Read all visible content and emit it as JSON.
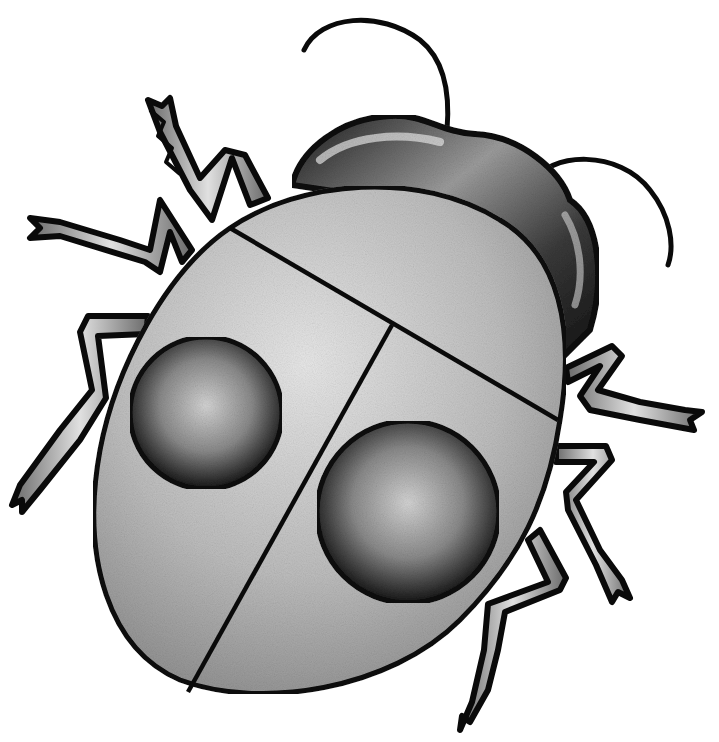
{
  "image": {
    "subject": "ladybug beetle illustration",
    "style": "grayscale stippled pencil drawing",
    "colors": {
      "background": "#ffffff",
      "outline": "#0a0a0a",
      "shell_fill": "#b8b8b8",
      "shell_highlight": "#e6e6e6",
      "spot_dark": "#1a1a1a",
      "spot_light": "#d0d0d0",
      "head_dark": "#151515",
      "head_light": "#cfcfcf",
      "leg_fill": "#9a9a9a"
    },
    "parts": {
      "spots": 2,
      "legs": 6,
      "antennae": 2
    }
  }
}
